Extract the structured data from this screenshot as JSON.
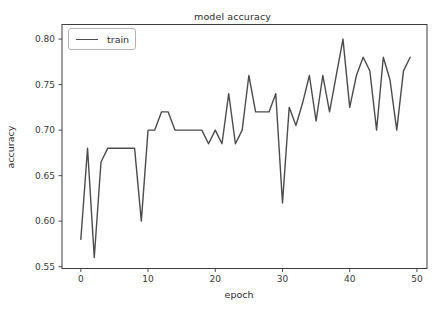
{
  "chart_data": {
    "type": "line",
    "title": "model accuracy",
    "xlabel": "epoch",
    "ylabel": "accuracy",
    "grid": false,
    "legend_position": "upper left",
    "xlim": [
      -2.8,
      51.5
    ],
    "ylim": [
      0.548,
      0.816
    ],
    "x_ticks": [
      0,
      10,
      20,
      30,
      40,
      50
    ],
    "x_tick_labels": [
      "0",
      "10",
      "20",
      "30",
      "40",
      "50"
    ],
    "y_ticks": [
      0.55,
      0.6,
      0.65,
      0.7,
      0.75,
      0.8
    ],
    "y_tick_labels": [
      "0.55",
      "0.60",
      "0.65",
      "0.70",
      "0.75",
      "0.80"
    ],
    "colors": {
      "line": "#4c4c4c",
      "spine": "#3c3c3c",
      "tick_text": "#3a3a3a",
      "legend_border": "#b4b4b4",
      "background": "#ffffff"
    },
    "series": [
      {
        "name": "train",
        "x": [
          0,
          1,
          2,
          3,
          4,
          5,
          6,
          7,
          8,
          9,
          10,
          11,
          12,
          13,
          14,
          15,
          16,
          17,
          18,
          19,
          20,
          21,
          22,
          23,
          24,
          25,
          26,
          27,
          28,
          29,
          30,
          31,
          32,
          33,
          34,
          35,
          36,
          37,
          38,
          39,
          40,
          41,
          42,
          43,
          44,
          45,
          46,
          47,
          48,
          49
        ],
        "values": [
          0.58,
          0.68,
          0.56,
          0.665,
          0.68,
          0.68,
          0.68,
          0.68,
          0.68,
          0.6,
          0.7,
          0.7,
          0.72,
          0.72,
          0.7,
          0.7,
          0.7,
          0.7,
          0.7,
          0.685,
          0.7,
          0.685,
          0.74,
          0.685,
          0.7,
          0.76,
          0.72,
          0.72,
          0.72,
          0.74,
          0.62,
          0.725,
          0.705,
          0.73,
          0.76,
          0.71,
          0.76,
          0.72,
          0.76,
          0.8,
          0.725,
          0.76,
          0.78,
          0.765,
          0.7,
          0.78,
          0.755,
          0.7,
          0.765,
          0.78
        ]
      }
    ]
  }
}
